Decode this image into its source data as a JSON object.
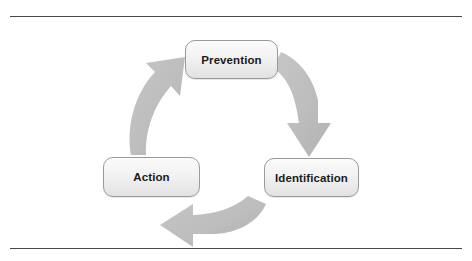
{
  "figure": {
    "type": "cycle-diagram",
    "title": "",
    "direction": "clockwise",
    "rules": {
      "top_divider": "horizontal-rule",
      "bottom_divider": "horizontal-rule"
    },
    "colors": {
      "node_border": "#9a9a9a",
      "node_fill_top": "#fbfbfb",
      "node_fill_bottom": "#e2e2e2",
      "node_text": "#1b1b1b",
      "arrow_fill": "#bcbcbc",
      "rule": "#4a4a4a",
      "background": "#ffffff"
    },
    "nodes": [
      {
        "id": "prevention",
        "label": "Prevention"
      },
      {
        "id": "identification",
        "label": "Identification"
      },
      {
        "id": "action",
        "label": "Action"
      }
    ],
    "arrows": [
      {
        "id": "prevention-to-identification",
        "from": "Prevention",
        "to": "Identification",
        "icon": "curved-arrow-down-icon"
      },
      {
        "id": "identification-to-action",
        "from": "Identification",
        "to": "Action",
        "icon": "curved-arrow-left-icon"
      },
      {
        "id": "action-to-prevention",
        "from": "Action",
        "to": "Prevention",
        "icon": "curved-arrow-up-icon"
      }
    ]
  }
}
